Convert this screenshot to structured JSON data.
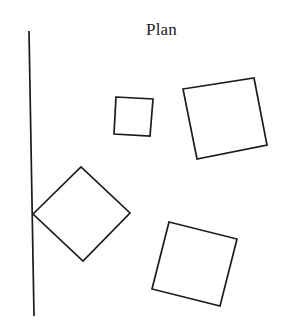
{
  "diagram": {
    "title": "Plan",
    "stroke_color": "#1c1c1c",
    "background": "#ffffff",
    "wall_line": {
      "x1": 29,
      "y1": 31,
      "x2": 34,
      "y2": 316
    },
    "shapes": [
      {
        "name": "small-square",
        "points": "116,97 153,99 150,136 114,134"
      },
      {
        "name": "large-square",
        "points": "183,89 254,78 267,145 197,159"
      },
      {
        "name": "diamond",
        "points": "33,214 81,167 130,213 83,261"
      },
      {
        "name": "bottom-square",
        "points": "169,222 237,239 220,306 152,289"
      }
    ]
  }
}
